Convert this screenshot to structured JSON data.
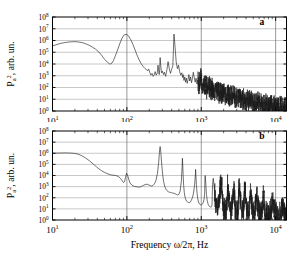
{
  "figure": {
    "background_color": "#ffffff",
    "trace_color": "#1a1a1a",
    "grid_color": "#9a9a9a",
    "axis_color": "#000000",
    "width": 302,
    "height": 260
  },
  "axis": {
    "xlabel_prefix": "Frequency ",
    "xlabel_symbol": "ω/2π",
    "xlabel_suffix": ", Hz",
    "xlabel_full": "Frequency ω/2π, Hz",
    "ylabel_main": "P",
    "ylabel_sub": "a",
    "ylabel_sup": "2",
    "ylabel_tail": ", arb. un.",
    "ylabel_full": "Pₐ², arb. un.",
    "x_tick_labels": [
      "10¹",
      "10²",
      "10³",
      "10⁴"
    ],
    "x_tick_exponents": [
      "1",
      "2",
      "3",
      "4"
    ],
    "x_tick_mantissa": "10",
    "y_tick_labels": [
      "10⁸",
      "10⁷",
      "10⁶",
      "10⁵",
      "10⁴",
      "10³",
      "10²",
      "10¹",
      "10⁰"
    ],
    "y_tick_exponents": [
      "8",
      "7",
      "6",
      "5",
      "4",
      "3",
      "2",
      "1",
      "0"
    ],
    "y_tick_mantissa": "10"
  },
  "panels": [
    {
      "id": "a",
      "label": "a",
      "label_x_frac": 0.895,
      "label_y_decade": 7.35
    },
    {
      "id": "b",
      "label": "b",
      "label_x_frac": 0.895,
      "label_y_decade": 7.3
    }
  ],
  "chart_data": [
    {
      "type": "line",
      "panel": "a",
      "title": "",
      "xlabel": "Frequency ω/2π, Hz",
      "ylabel": "Pₐ², arb. un.",
      "xscale": "log",
      "yscale": "log",
      "xlim": [
        10,
        14000
      ],
      "ylim": [
        1,
        100000000
      ],
      "xticks": [
        10,
        100,
        1000,
        10000
      ],
      "yticks": [
        1,
        10,
        100,
        1000,
        10000,
        100000,
        1000000,
        10000000,
        100000000
      ],
      "grid": true,
      "legend": false,
      "annotations": [
        {
          "text": "a",
          "x": 6000,
          "y": 22000000
        }
      ],
      "description": "Broadband noisy power spectrum with smooth low-frequency hump near 60 Hz reaching 10^6.5, sharp peak near 280 Hz at 10^6.6, progressive decay into dense grass-like noise floor near 10^0 beyond 3 kHz",
      "x": [
        10,
        11,
        12,
        13,
        14,
        16,
        18,
        20,
        22,
        25,
        28,
        31,
        34,
        38,
        42,
        46,
        50,
        55,
        58,
        60,
        63,
        66,
        70,
        75,
        80,
        86,
        92,
        98,
        100,
        105,
        112,
        120,
        128,
        136,
        145,
        155,
        165,
        175,
        185,
        190,
        196,
        203,
        210,
        218,
        226,
        234,
        240,
        248,
        256,
        262,
        268,
        272,
        276,
        280,
        285,
        292,
        300,
        310,
        320,
        332,
        345,
        358,
        372,
        386,
        400,
        415,
        430,
        445,
        460,
        478,
        495,
        512,
        530,
        548,
        560,
        572,
        585,
        600,
        615,
        630,
        648,
        665,
        682,
        700,
        720,
        740,
        760,
        782,
        805,
        828,
        852,
        876,
        900,
        925,
        950,
        980,
        1010,
        1040,
        1075,
        1110,
        1145,
        1180,
        1220,
        1260,
        1300,
        1345,
        1390,
        1435,
        1480,
        1530,
        1580,
        1630,
        1685,
        1740,
        1800,
        1860,
        1920,
        1985,
        2050,
        2120,
        2190,
        2260,
        2335,
        2410,
        2490,
        2570,
        2655,
        2740,
        2830,
        2925,
        3020,
        3120,
        3220,
        3330,
        3440,
        3550,
        3670,
        3790,
        3915,
        4040,
        4175,
        4310,
        4450,
        4600,
        4750,
        4900,
        5060,
        5230,
        5400,
        5580,
        5760,
        5950,
        6140,
        6340,
        6550,
        6760,
        6980,
        7210,
        7450,
        7690,
        7940,
        8200,
        8470,
        8750,
        9030,
        9330,
        9630,
        9950,
        10300,
        10600,
        11000,
        11350,
        11700,
        12100,
        12500,
        12900,
        13300,
        13700,
        14000
      ],
      "y_log10": [
        5.55,
        5.62,
        5.7,
        5.76,
        5.8,
        5.86,
        5.89,
        5.9,
        5.88,
        5.82,
        5.72,
        5.6,
        5.46,
        5.26,
        5.02,
        4.72,
        4.4,
        4.15,
        4.03,
        4.0,
        4.08,
        4.3,
        4.7,
        5.2,
        5.7,
        6.2,
        6.48,
        6.52,
        6.5,
        6.4,
        6.1,
        5.7,
        5.25,
        4.8,
        4.4,
        4.05,
        3.8,
        3.62,
        3.5,
        3.42,
        3.58,
        3.3,
        3.05,
        3.2,
        2.95,
        3.1,
        3.35,
        3.05,
        3.22,
        3.9,
        3.4,
        3.1,
        3.5,
        4.55,
        3.9,
        3.25,
        3.4,
        3.1,
        3.3,
        2.95,
        3.5,
        4.2,
        3.6,
        3.2,
        3.55,
        3.85,
        6.55,
        5.4,
        4.2,
        3.6,
        3.9,
        3.35,
        3.05,
        3.25,
        2.85,
        3.1,
        2.6,
        2.9,
        2.45,
        2.8,
        2.35,
        2.7,
        3.1,
        2.55,
        2.9,
        2.4,
        2.75,
        3.3,
        2.85,
        2.45,
        2.8,
        2.3,
        2.65,
        2.2,
        2.55,
        2.95,
        2.4,
        2.1,
        2.5,
        2.05,
        2.35,
        1.95,
        2.25,
        1.85,
        2.15,
        1.75,
        2.05,
        1.7,
        1.95,
        1.6,
        1.85,
        1.55,
        1.75,
        1.5,
        1.65,
        1.45,
        1.6,
        1.4,
        1.55,
        1.35,
        1.5,
        1.3,
        1.45,
        1.25,
        1.4,
        1.22,
        1.35,
        1.18,
        1.3,
        1.15,
        1.25,
        1.1,
        1.2,
        1.05,
        1.15,
        1.0,
        1.1,
        0.95,
        1.05,
        0.9,
        1.0,
        0.86,
        0.95,
        0.82,
        0.9,
        0.78,
        0.86,
        0.74,
        0.82,
        0.7,
        0.78,
        0.66,
        0.74,
        0.62,
        0.7,
        0.58,
        0.66,
        0.55,
        0.62,
        0.52,
        0.58,
        0.48,
        0.55,
        0.45,
        0.5,
        0.42,
        0.48,
        0.4,
        0.45,
        0.38,
        0.42,
        0.36,
        0.4,
        0.34,
        0.38,
        0.33,
        0.36,
        0.32
      ]
    },
    {
      "type": "line",
      "panel": "b",
      "title": "",
      "xlabel": "Frequency ω/2π, Hz",
      "ylabel": "Pₐ², arb. un.",
      "xscale": "log",
      "yscale": "log",
      "xlim": [
        10,
        14000
      ],
      "ylim": [
        1,
        100000000
      ],
      "xticks": [
        10,
        100,
        1000,
        10000
      ],
      "yticks": [
        1,
        10,
        100,
        1000,
        10000,
        100000,
        1000000,
        10000000,
        100000000
      ],
      "grid": true,
      "legend": false,
      "annotations": [
        {
          "text": "b",
          "x": 6000,
          "y": 20000000
        }
      ],
      "description": "Flat plateau at 10^6 below 20 Hz, monotonic decay to 10^3 near 90 Hz, small bump at 95 Hz, dominant sharp fundamental peak at 280 Hz reaching 10^6.6, regular harmonic spike comb at 560, 840, 1120 Hz etc decaying into noise floor near 10^0",
      "x": [
        10,
        11,
        12,
        13,
        14,
        15,
        16,
        17,
        18,
        19,
        20,
        22,
        24,
        26,
        28,
        30,
        33,
        36,
        39,
        42,
        46,
        50,
        54,
        58,
        62,
        66,
        70,
        74,
        78,
        82,
        86,
        90,
        93,
        96,
        99,
        102,
        106,
        110,
        115,
        120,
        126,
        132,
        138,
        145,
        152,
        160,
        168,
        176,
        185,
        194,
        204,
        214,
        224,
        235,
        246,
        258,
        268,
        274,
        278,
        280,
        283,
        288,
        295,
        303,
        312,
        322,
        333,
        345,
        358,
        372,
        386,
        400,
        415,
        430,
        446,
        463,
        480,
        500,
        520,
        540,
        553,
        558,
        562,
        570,
        580,
        592,
        605,
        620,
        636,
        652,
        670,
        690,
        710,
        732,
        755,
        778,
        802,
        820,
        836,
        840,
        846,
        860,
        878,
        898,
        920,
        945,
        970,
        998,
        1028,
        1060,
        1092,
        1112,
        1120,
        1130,
        1150,
        1175,
        1205,
        1240,
        1275,
        1315,
        1355,
        1385,
        1398,
        1405,
        1420,
        1450,
        1490,
        1535,
        1580,
        1630,
        1665,
        1680,
        1695,
        1730,
        1780,
        1835,
        1895,
        1940,
        1958,
        1975,
        2020,
        2080,
        2145,
        2210,
        2240,
        2260,
        2290,
        2350,
        2420,
        2490,
        2520,
        2545,
        2580,
        2650,
        2730,
        2800,
        2830,
        2860,
        2920,
        3000,
        3090,
        3130,
        3160,
        3230,
        3320,
        3400,
        3440,
        3480,
        3570,
        3670,
        3720,
        3760,
        3850,
        3950,
        4010,
        4060,
        4160,
        4270,
        4320,
        4380,
        4500,
        4620,
        4680,
        4750,
        4880,
        5000,
        5080,
        5160,
        5300,
        5440,
        5520,
        5620,
        5780,
        5900,
        6000,
        6120,
        6300,
        6450,
        6600,
        6800,
        7000,
        7200,
        7450,
        7700,
        7950,
        8200,
        8500,
        8800,
        9100,
        9400,
        9700,
        10050,
        10400,
        10750,
        11100,
        11500,
        11900,
        12300,
        12700,
        13100,
        13500,
        14000
      ],
      "y_log10": [
        6.0,
        6.01,
        6.02,
        6.02,
        6.03,
        6.03,
        6.02,
        6.02,
        6.01,
        6.0,
        5.98,
        5.92,
        5.82,
        5.7,
        5.56,
        5.42,
        5.2,
        4.98,
        4.78,
        4.6,
        4.42,
        4.28,
        4.18,
        4.1,
        4.05,
        4.02,
        4.0,
        3.96,
        3.88,
        3.74,
        3.56,
        3.36,
        3.45,
        3.85,
        4.2,
        4.05,
        3.65,
        3.35,
        3.18,
        3.08,
        3.02,
        3.0,
        2.98,
        2.95,
        2.98,
        3.05,
        3.12,
        3.18,
        3.22,
        3.18,
        3.1,
        3.05,
        3.1,
        3.25,
        3.55,
        4.2,
        5.2,
        6.1,
        6.52,
        6.6,
        6.45,
        5.8,
        4.9,
        4.05,
        3.45,
        3.05,
        2.8,
        2.65,
        2.55,
        2.5,
        2.48,
        2.45,
        2.42,
        2.4,
        2.35,
        2.3,
        2.25,
        2.3,
        2.6,
        3.5,
        4.8,
        5.55,
        5.2,
        4.1,
        3.1,
        2.45,
        2.05,
        1.85,
        1.7,
        1.62,
        1.58,
        1.55,
        1.6,
        1.75,
        1.95,
        2.25,
        2.8,
        3.4,
        4.2,
        4.55,
        4.1,
        3.2,
        2.4,
        1.9,
        1.6,
        1.45,
        1.38,
        1.35,
        1.4,
        1.55,
        1.85,
        2.5,
        3.6,
        4.0,
        3.3,
        2.3,
        1.7,
        1.4,
        1.25,
        1.18,
        1.15,
        1.2,
        1.45,
        2.2,
        3.2,
        3.75,
        3.0,
        2.05,
        1.5,
        1.25,
        1.1,
        1.05,
        1.15,
        1.6,
        2.6,
        3.4,
        2.8,
        1.9,
        1.35,
        1.05,
        0.95,
        0.9,
        1.0,
        1.5,
        2.45,
        3.15,
        2.6,
        1.75,
        1.2,
        0.92,
        0.82,
        0.85,
        1.3,
        2.3,
        3.0,
        2.45,
        1.65,
        1.1,
        0.85,
        0.75,
        0.78,
        1.2,
        2.1,
        2.85,
        2.3,
        1.55,
        1.02,
        0.78,
        0.7,
        0.72,
        1.1,
        1.95,
        2.7,
        2.18,
        1.45,
        0.95,
        0.72,
        0.65,
        0.68,
        1.0,
        1.8,
        2.55,
        2.05,
        1.35,
        0.88,
        0.66,
        0.6,
        0.62,
        0.92,
        1.65,
        2.4,
        1.92,
        1.25,
        0.8,
        0.6,
        0.55,
        0.58,
        0.85,
        1.45,
        2.1,
        1.7,
        1.1,
        0.72,
        0.55,
        0.5,
        0.52,
        0.72,
        1.15,
        1.6,
        1.3,
        0.88,
        0.6,
        0.48,
        0.45,
        0.46,
        0.58,
        0.8,
        1.0,
        0.85,
        0.62,
        0.48,
        0.42,
        0.4,
        0.38,
        0.36,
        0.35,
        0.34,
        0.33,
        0.32,
        0.31,
        0.3
      ]
    }
  ]
}
